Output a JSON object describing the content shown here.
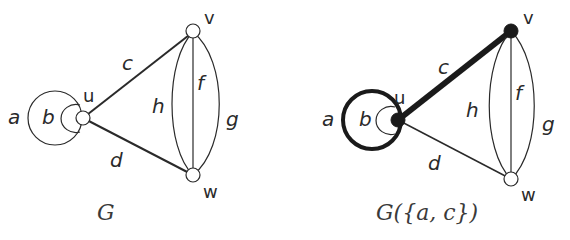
{
  "graphs": [
    {
      "caption_main": "G",
      "caption_rest": "",
      "vertices": [
        {
          "id": "u",
          "label": "u",
          "filled": false
        },
        {
          "id": "v",
          "label": "v",
          "filled": false
        },
        {
          "id": "w",
          "label": "w",
          "filled": false
        }
      ],
      "edges": [
        {
          "id": "a",
          "label": "a",
          "ends": [
            "u",
            "u"
          ],
          "type": "loop",
          "bold": false
        },
        {
          "id": "b",
          "label": "b",
          "ends": [
            "u",
            "u"
          ],
          "type": "loop",
          "bold": false
        },
        {
          "id": "c",
          "label": "c",
          "ends": [
            "u",
            "v"
          ],
          "type": "line",
          "bold": false
        },
        {
          "id": "d",
          "label": "d",
          "ends": [
            "u",
            "w"
          ],
          "type": "line",
          "bold": false
        },
        {
          "id": "f",
          "label": "f",
          "ends": [
            "v",
            "w"
          ],
          "type": "line",
          "bold": false
        },
        {
          "id": "g",
          "label": "g",
          "ends": [
            "v",
            "w"
          ],
          "type": "arc",
          "bold": false
        },
        {
          "id": "h",
          "label": "h",
          "ends": [
            "v",
            "w"
          ],
          "type": "arc",
          "bold": false
        }
      ]
    },
    {
      "caption_main": "G",
      "caption_rest": "({a, c})",
      "vertices": [
        {
          "id": "u",
          "label": "u",
          "filled": true
        },
        {
          "id": "v",
          "label": "v",
          "filled": true
        },
        {
          "id": "w",
          "label": "w",
          "filled": false
        }
      ],
      "edges": [
        {
          "id": "a",
          "label": "a",
          "ends": [
            "u",
            "u"
          ],
          "type": "loop",
          "bold": true
        },
        {
          "id": "b",
          "label": "b",
          "ends": [
            "u",
            "u"
          ],
          "type": "loop",
          "bold": false
        },
        {
          "id": "c",
          "label": "c",
          "ends": [
            "u",
            "v"
          ],
          "type": "line",
          "bold": true
        },
        {
          "id": "d",
          "label": "d",
          "ends": [
            "u",
            "w"
          ],
          "type": "line",
          "bold": false
        },
        {
          "id": "f",
          "label": "f",
          "ends": [
            "v",
            "w"
          ],
          "type": "line",
          "bold": false
        },
        {
          "id": "g",
          "label": "g",
          "ends": [
            "v",
            "w"
          ],
          "type": "arc",
          "bold": false
        },
        {
          "id": "h",
          "label": "h",
          "ends": [
            "v",
            "w"
          ],
          "type": "arc",
          "bold": false
        }
      ]
    }
  ],
  "colors": {
    "stroke": "#2a2a2a",
    "highlight": "#1a1a1a",
    "background": "#ffffff"
  }
}
